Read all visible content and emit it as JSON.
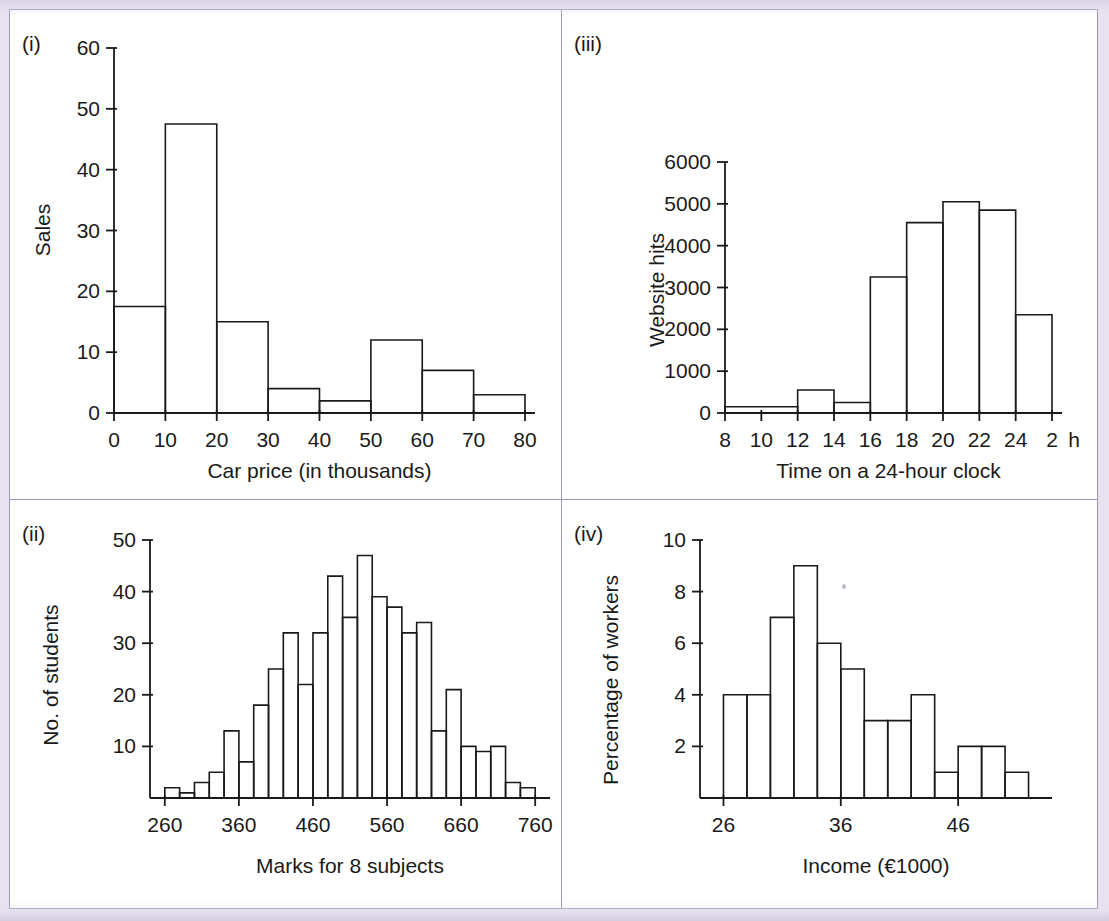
{
  "page": {
    "background_color": "#e6e2ee",
    "panel_color": "#ffffff",
    "divider_color": "#9d94b8",
    "ink_color": "#1a1a1a"
  },
  "panels": [
    {
      "key": "i",
      "label": "(i)"
    },
    {
      "key": "iii",
      "label": "(iii)"
    },
    {
      "key": "ii",
      "label": "(ii)"
    },
    {
      "key": "iv",
      "label": "(iv)"
    }
  ],
  "chart_data": [
    {
      "id": "i",
      "panel_label": "(i)",
      "type": "bar",
      "title": "",
      "xlabel": "Car price (in thousands)",
      "ylabel": "Sales",
      "xticks": [
        0,
        10,
        20,
        30,
        40,
        50,
        60,
        70,
        80
      ],
      "xticklabels": [
        "0",
        "10",
        "20",
        "30",
        "40",
        "50",
        "60",
        "70",
        "80"
      ],
      "yticks": [
        0,
        10,
        20,
        30,
        40,
        50,
        60
      ],
      "yticklabels": [
        "0",
        "10",
        "20",
        "30",
        "40",
        "50",
        "60"
      ],
      "xlim": [
        0,
        80
      ],
      "ylim": [
        0,
        60
      ],
      "grid": false,
      "bin_edges": [
        0,
        10,
        20,
        30,
        40,
        50,
        60,
        70,
        80
      ],
      "values": [
        17.5,
        47.5,
        15,
        4,
        2,
        12,
        7,
        3
      ]
    },
    {
      "id": "iii",
      "panel_label": "(iii)",
      "type": "bar",
      "title": "",
      "xlabel": "Time on a 24-hour clock",
      "ylabel": "Website hits",
      "xticks": [
        8,
        10,
        12,
        14,
        16,
        18,
        20,
        22,
        24,
        26
      ],
      "xticklabels": [
        "8",
        "10",
        "12",
        "14",
        "16",
        "18",
        "20",
        "22",
        "24",
        "2"
      ],
      "xtick_suffix": "h",
      "yticks": [
        0,
        1000,
        2000,
        3000,
        4000,
        5000,
        6000
      ],
      "yticklabels": [
        "0",
        "1000",
        "2000",
        "3000",
        "4000",
        "5000",
        "6000"
      ],
      "xlim": [
        8,
        26
      ],
      "ylim": [
        0,
        6000
      ],
      "grid": false,
      "bin_edges": [
        8,
        12,
        14,
        16,
        18,
        20,
        22,
        24,
        26
      ],
      "values": [
        150,
        550,
        250,
        3250,
        4550,
        5050,
        4850,
        2350
      ]
    },
    {
      "id": "ii",
      "panel_label": "(ii)",
      "type": "bar",
      "title": "",
      "xlabel": "Marks for 8 subjects",
      "ylabel": "No. of students",
      "xticks": [
        260,
        360,
        460,
        560,
        660,
        760
      ],
      "xticklabels": [
        "260",
        "360",
        "460",
        "560",
        "660",
        "760"
      ],
      "yticks": [
        10,
        20,
        30,
        40,
        50
      ],
      "yticklabels": [
        "10",
        "20",
        "30",
        "40",
        "50"
      ],
      "xlim": [
        240,
        780
      ],
      "ylim": [
        0,
        50
      ],
      "grid": false,
      "bin_width": 20,
      "bin_edges": [
        260,
        280,
        300,
        320,
        340,
        360,
        380,
        400,
        420,
        440,
        460,
        480,
        500,
        520,
        540,
        560,
        580,
        600,
        620,
        640,
        660,
        680,
        700,
        720,
        740,
        760
      ],
      "values": [
        2,
        1,
        3,
        5,
        13,
        7,
        18,
        25,
        32,
        22,
        32,
        43,
        35,
        47,
        39,
        37,
        32,
        34,
        13,
        21,
        10,
        9,
        10,
        3,
        2
      ]
    },
    {
      "id": "iv",
      "panel_label": "(iv)",
      "type": "bar",
      "title": "",
      "xlabel": "Income (€1000)",
      "ylabel": "Percentage of workers",
      "xticks": [
        26,
        36,
        46
      ],
      "xticklabels": [
        "26",
        "36",
        "46"
      ],
      "yticks": [
        2,
        4,
        6,
        8,
        10
      ],
      "yticklabels": [
        "2",
        "4",
        "6",
        "8",
        "10"
      ],
      "xlim": [
        24,
        54
      ],
      "ylim": [
        0,
        10
      ],
      "grid": false,
      "bin_width": 2,
      "bin_edges": [
        26,
        28,
        30,
        32,
        34,
        36,
        38,
        40,
        42,
        44,
        46,
        48,
        50,
        52
      ],
      "values": [
        4,
        4,
        7,
        9,
        6,
        5,
        3,
        3,
        4,
        1,
        2,
        2,
        1
      ]
    }
  ]
}
